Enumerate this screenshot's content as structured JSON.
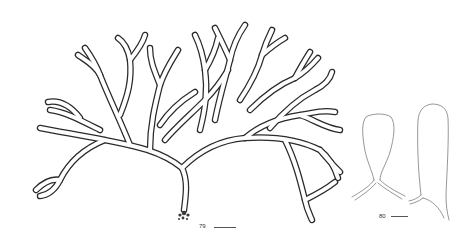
{
  "plate": {
    "figures": [
      {
        "id": "fig-79",
        "label": "79",
        "subject": "branched thallus of alga with holdfast",
        "scale_bar": true
      },
      {
        "id": "fig-80",
        "label": "80",
        "subject": "two apical cells / branch tips outline",
        "scale_bar": true
      }
    ],
    "colors": {
      "background": "#ffffff",
      "ink": "#2a2a2a",
      "stipple": "#9a9a9a"
    }
  }
}
